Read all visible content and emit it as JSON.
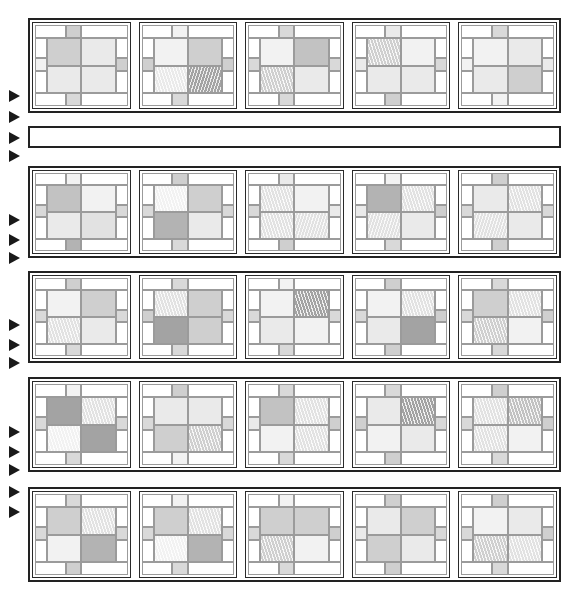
{
  "figure": {
    "canvas": {
      "width": 567,
      "height": 604
    },
    "background_color": "#ffffff",
    "outline_color": "#222222",
    "seam_color": "#9b9b9b",
    "arrow_color": "#1a1a1a"
  },
  "palette": {
    "white": "#ffffff",
    "near_white": "#fbfbfb",
    "pale": "#f2f2f2",
    "light": "#eaeaea",
    "light2": "#e2e2e2",
    "mid_light": "#d9d9d9",
    "mid": "#cfcfcf",
    "mid_dark": "#c2c2c2",
    "dark": "#b3b3b3",
    "darker": "#a3a3a3"
  },
  "layout": {
    "columns": 5,
    "band_count": 5,
    "spacer_band_after_band": 1,
    "left_gutter_width": 28,
    "band_geometry": [
      {
        "id": "band-1",
        "x": 28,
        "y": 18,
        "w": 533,
        "h": 95
      },
      {
        "id": "spacer",
        "x": 28,
        "y": 126,
        "w": 533,
        "h": 22
      },
      {
        "id": "band-2",
        "x": 28,
        "y": 166,
        "w": 533,
        "h": 92
      },
      {
        "id": "band-3",
        "x": 28,
        "y": 271,
        "w": 533,
        "h": 92
      },
      {
        "id": "band-4",
        "x": 28,
        "y": 377,
        "w": 533,
        "h": 95
      },
      {
        "id": "band-5",
        "x": 28,
        "y": 487,
        "w": 533,
        "h": 95
      }
    ],
    "arrow_markers": [
      {
        "y": 96
      },
      {
        "y": 117
      },
      {
        "y": 138
      },
      {
        "y": 156
      },
      {
        "y": 220
      },
      {
        "y": 240
      },
      {
        "y": 258
      },
      {
        "y": 325
      },
      {
        "y": 345
      },
      {
        "y": 363
      },
      {
        "y": 432
      },
      {
        "y": 452
      },
      {
        "y": 470
      },
      {
        "y": 492
      },
      {
        "y": 512
      }
    ]
  },
  "bands": [
    {
      "id": "band-1",
      "cells": [
        {
          "id": "r1c1",
          "top_tab": "mid",
          "bottom_tab": "mid_light",
          "left_tab": "pale",
          "right_tab": "mid",
          "quads": [
            {
              "fill": "mid",
              "hatch": "none"
            },
            {
              "fill": "light",
              "hatch": "none"
            },
            {
              "fill": "light",
              "hatch": "none"
            },
            {
              "fill": "light",
              "hatch": "none"
            }
          ]
        },
        {
          "id": "r1c2",
          "top_tab": "pale",
          "bottom_tab": "mid_light",
          "left_tab": "mid",
          "right_tab": "mid",
          "quads": [
            {
              "fill": "pale",
              "hatch": "none"
            },
            {
              "fill": "mid",
              "hatch": "none"
            },
            {
              "fill": "light",
              "hatch": "diag"
            },
            {
              "fill": "darker",
              "hatch": "diag2"
            }
          ]
        },
        {
          "id": "r1c3",
          "top_tab": "mid_light",
          "bottom_tab": "mid_light",
          "left_tab": "mid_light",
          "right_tab": "mid_light",
          "quads": [
            {
              "fill": "pale",
              "hatch": "none"
            },
            {
              "fill": "mid_dark",
              "hatch": "none"
            },
            {
              "fill": "mid",
              "hatch": "diag"
            },
            {
              "fill": "light",
              "hatch": "none"
            }
          ]
        },
        {
          "id": "r1c4",
          "top_tab": "light",
          "bottom_tab": "mid",
          "left_tab": "light",
          "right_tab": "mid_light",
          "quads": [
            {
              "fill": "mid",
              "hatch": "diag"
            },
            {
              "fill": "pale",
              "hatch": "none"
            },
            {
              "fill": "light",
              "hatch": "none"
            },
            {
              "fill": "light",
              "hatch": "none"
            }
          ]
        },
        {
          "id": "r1c5",
          "top_tab": "mid_light",
          "bottom_tab": "pale",
          "left_tab": "pale",
          "right_tab": "light",
          "quads": [
            {
              "fill": "pale",
              "hatch": "none"
            },
            {
              "fill": "light",
              "hatch": "none"
            },
            {
              "fill": "light",
              "hatch": "none"
            },
            {
              "fill": "mid",
              "hatch": "none"
            }
          ]
        }
      ]
    },
    {
      "id": "band-2",
      "cells": [
        {
          "id": "r2c1",
          "top_tab": "pale",
          "bottom_tab": "dark",
          "left_tab": "mid_light",
          "right_tab": "mid_light",
          "quads": [
            {
              "fill": "mid_dark",
              "hatch": "none"
            },
            {
              "fill": "pale",
              "hatch": "none"
            },
            {
              "fill": "light",
              "hatch": "none"
            },
            {
              "fill": "light2",
              "hatch": "none"
            }
          ]
        },
        {
          "id": "r2c2",
          "top_tab": "mid",
          "bottom_tab": "mid_light",
          "left_tab": "mid_light",
          "right_tab": "mid_light",
          "quads": [
            {
              "fill": "pale",
              "hatch": "diag"
            },
            {
              "fill": "mid",
              "hatch": "none"
            },
            {
              "fill": "dark",
              "hatch": "none"
            },
            {
              "fill": "light",
              "hatch": "none"
            }
          ]
        },
        {
          "id": "r2c3",
          "top_tab": "light",
          "bottom_tab": "mid",
          "left_tab": "mid_light",
          "right_tab": "light",
          "quads": [
            {
              "fill": "light2",
              "hatch": "diag"
            },
            {
              "fill": "pale",
              "hatch": "none"
            },
            {
              "fill": "light2",
              "hatch": "diag"
            },
            {
              "fill": "light2",
              "hatch": "diag2"
            }
          ]
        },
        {
          "id": "r2c4",
          "top_tab": "pale",
          "bottom_tab": "mid_light",
          "left_tab": "light",
          "right_tab": "mid",
          "quads": [
            {
              "fill": "dark",
              "hatch": "none"
            },
            {
              "fill": "light2",
              "hatch": "diag"
            },
            {
              "fill": "light2",
              "hatch": "diag2"
            },
            {
              "fill": "light",
              "hatch": "none"
            }
          ]
        },
        {
          "id": "r2c5",
          "top_tab": "mid",
          "bottom_tab": "mid",
          "left_tab": "mid_light",
          "right_tab": "mid_light",
          "quads": [
            {
              "fill": "light",
              "hatch": "none"
            },
            {
              "fill": "light2",
              "hatch": "diag"
            },
            {
              "fill": "light2",
              "hatch": "diag2"
            },
            {
              "fill": "light",
              "hatch": "none"
            }
          ]
        }
      ]
    },
    {
      "id": "band-3",
      "cells": [
        {
          "id": "r3c1",
          "top_tab": "mid",
          "bottom_tab": "mid_light",
          "left_tab": "mid_light",
          "right_tab": "mid_light",
          "quads": [
            {
              "fill": "pale",
              "hatch": "none"
            },
            {
              "fill": "mid",
              "hatch": "none"
            },
            {
              "fill": "light2",
              "hatch": "diag"
            },
            {
              "fill": "light",
              "hatch": "none"
            }
          ]
        },
        {
          "id": "r3c2",
          "top_tab": "mid_light",
          "bottom_tab": "mid_light",
          "left_tab": "mid",
          "right_tab": "mid_light",
          "quads": [
            {
              "fill": "light2",
              "hatch": "diag"
            },
            {
              "fill": "mid",
              "hatch": "none"
            },
            {
              "fill": "darker",
              "hatch": "none"
            },
            {
              "fill": "mid",
              "hatch": "none"
            }
          ]
        },
        {
          "id": "r3c3",
          "top_tab": "pale",
          "bottom_tab": "mid_light",
          "left_tab": "mid_light",
          "right_tab": "mid_light",
          "quads": [
            {
              "fill": "pale",
              "hatch": "none"
            },
            {
              "fill": "darker",
              "hatch": "diag"
            },
            {
              "fill": "light",
              "hatch": "none"
            },
            {
              "fill": "pale",
              "hatch": "none"
            }
          ]
        },
        {
          "id": "r3c4",
          "top_tab": "mid",
          "bottom_tab": "mid",
          "left_tab": "mid_light",
          "right_tab": "mid",
          "quads": [
            {
              "fill": "pale",
              "hatch": "none"
            },
            {
              "fill": "light2",
              "hatch": "diag"
            },
            {
              "fill": "light",
              "hatch": "none"
            },
            {
              "fill": "darker",
              "hatch": "none"
            }
          ]
        },
        {
          "id": "r3c5",
          "top_tab": "mid_light",
          "bottom_tab": "mid_light",
          "left_tab": "mid_light",
          "right_tab": "mid",
          "quads": [
            {
              "fill": "mid",
              "hatch": "none"
            },
            {
              "fill": "light2",
              "hatch": "diag"
            },
            {
              "fill": "mid",
              "hatch": "diag"
            },
            {
              "fill": "pale",
              "hatch": "none"
            }
          ]
        }
      ]
    },
    {
      "id": "band-4",
      "cells": [
        {
          "id": "r4c1",
          "top_tab": "pale",
          "bottom_tab": "mid_light",
          "left_tab": "mid_light",
          "right_tab": "mid_light",
          "quads": [
            {
              "fill": "darker",
              "hatch": "none"
            },
            {
              "fill": "light2",
              "hatch": "diag"
            },
            {
              "fill": "pale",
              "hatch": "diag"
            },
            {
              "fill": "darker",
              "hatch": "none"
            }
          ]
        },
        {
          "id": "r4c2",
          "top_tab": "mid",
          "bottom_tab": "pale",
          "left_tab": "mid_light",
          "right_tab": "mid_light",
          "quads": [
            {
              "fill": "light",
              "hatch": "none"
            },
            {
              "fill": "light",
              "hatch": "none"
            },
            {
              "fill": "mid",
              "hatch": "none"
            },
            {
              "fill": "mid",
              "hatch": "diag"
            }
          ]
        },
        {
          "id": "r4c3",
          "top_tab": "mid_light",
          "bottom_tab": "mid_light",
          "left_tab": "light",
          "right_tab": "mid",
          "quads": [
            {
              "fill": "mid_dark",
              "hatch": "none"
            },
            {
              "fill": "light2",
              "hatch": "diag"
            },
            {
              "fill": "pale",
              "hatch": "none"
            },
            {
              "fill": "light2",
              "hatch": "diag"
            }
          ]
        },
        {
          "id": "r4c4",
          "top_tab": "mid_light",
          "bottom_tab": "mid",
          "left_tab": "mid",
          "right_tab": "mid_light",
          "quads": [
            {
              "fill": "light",
              "hatch": "none"
            },
            {
              "fill": "darker",
              "hatch": "diag"
            },
            {
              "fill": "pale",
              "hatch": "none"
            },
            {
              "fill": "light",
              "hatch": "none"
            }
          ]
        },
        {
          "id": "r4c5",
          "top_tab": "mid",
          "bottom_tab": "mid_light",
          "left_tab": "mid_light",
          "right_tab": "mid",
          "quads": [
            {
              "fill": "light2",
              "hatch": "diag"
            },
            {
              "fill": "mid_dark",
              "hatch": "diag"
            },
            {
              "fill": "light2",
              "hatch": "diag"
            },
            {
              "fill": "pale",
              "hatch": "none"
            }
          ]
        }
      ]
    },
    {
      "id": "band-5",
      "cells": [
        {
          "id": "r5c1",
          "top_tab": "mid_light",
          "bottom_tab": "mid",
          "left_tab": "mid_light",
          "right_tab": "mid_light",
          "quads": [
            {
              "fill": "mid",
              "hatch": "none"
            },
            {
              "fill": "light2",
              "hatch": "diag"
            },
            {
              "fill": "pale",
              "hatch": "none"
            },
            {
              "fill": "dark",
              "hatch": "none"
            }
          ]
        },
        {
          "id": "r5c2",
          "top_tab": "pale",
          "bottom_tab": "mid_light",
          "left_tab": "mid_light",
          "right_tab": "mid_light",
          "quads": [
            {
              "fill": "mid",
              "hatch": "none"
            },
            {
              "fill": "light2",
              "hatch": "diag"
            },
            {
              "fill": "pale",
              "hatch": "diag"
            },
            {
              "fill": "dark",
              "hatch": "none"
            }
          ]
        },
        {
          "id": "r5c3",
          "top_tab": "pale",
          "bottom_tab": "mid_light",
          "left_tab": "mid_light",
          "right_tab": "mid",
          "quads": [
            {
              "fill": "mid",
              "hatch": "none"
            },
            {
              "fill": "mid",
              "hatch": "none"
            },
            {
              "fill": "mid",
              "hatch": "diag"
            },
            {
              "fill": "pale",
              "hatch": "none"
            }
          ]
        },
        {
          "id": "r5c4",
          "top_tab": "mid",
          "bottom_tab": "mid",
          "left_tab": "light",
          "right_tab": "mid_light",
          "quads": [
            {
              "fill": "light",
              "hatch": "none"
            },
            {
              "fill": "mid",
              "hatch": "none"
            },
            {
              "fill": "mid",
              "hatch": "none"
            },
            {
              "fill": "light",
              "hatch": "none"
            }
          ]
        },
        {
          "id": "r5c5",
          "top_tab": "mid",
          "bottom_tab": "mid_light",
          "left_tab": "mid_light",
          "right_tab": "mid",
          "quads": [
            {
              "fill": "pale",
              "hatch": "none"
            },
            {
              "fill": "light",
              "hatch": "none"
            },
            {
              "fill": "mid",
              "hatch": "diag"
            },
            {
              "fill": "light2",
              "hatch": "diag"
            }
          ]
        }
      ]
    }
  ]
}
